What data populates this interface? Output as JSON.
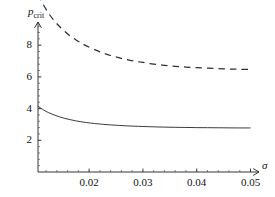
{
  "chart_data": {
    "type": "line",
    "title": "",
    "xlabel": "σ",
    "ylabel": "p_crit",
    "ylabel_base": "p",
    "ylabel_sub": "crit",
    "xlim": [
      0.0105,
      0.0514
    ],
    "ylim": [
      0.0,
      11.7
    ],
    "grid": false,
    "legend": "none",
    "xticks": [
      0.02,
      0.03,
      0.04,
      0.05
    ],
    "xtick_labels": [
      "0.02",
      "0.03",
      "0.04",
      "0.05"
    ],
    "yticks": [
      2,
      4,
      6,
      8,
      10
    ],
    "ytick_labels": [
      "2",
      "4",
      "6",
      "8",
      "10"
    ],
    "x_minor_per_interval": 4,
    "y_minor_per_interval": 4,
    "axis_arrows": true,
    "series": [
      {
        "name": "upper-branch",
        "style": "dashed",
        "color": "#303030",
        "x": [
          0.0105,
          0.0115,
          0.0125,
          0.0135,
          0.0145,
          0.0155,
          0.0165,
          0.0175,
          0.0185,
          0.0195,
          0.021,
          0.0225,
          0.024,
          0.0255,
          0.027,
          0.0285,
          0.03,
          0.032,
          0.034,
          0.036,
          0.038,
          0.04,
          0.042,
          0.044,
          0.046,
          0.048,
          0.05
        ],
        "y": [
          11.2,
          10.55,
          10.0,
          9.55,
          9.18,
          8.86,
          8.58,
          8.35,
          8.14,
          7.96,
          7.72,
          7.52,
          7.35,
          7.21,
          7.09,
          6.99,
          6.91,
          6.81,
          6.73,
          6.67,
          6.62,
          6.58,
          6.55,
          6.52,
          6.5,
          6.48,
          6.47
        ]
      },
      {
        "name": "lower-branch",
        "style": "solid",
        "color": "#303030",
        "x": [
          0.0105,
          0.0115,
          0.0125,
          0.0135,
          0.0145,
          0.0155,
          0.0165,
          0.0175,
          0.0185,
          0.0195,
          0.021,
          0.0225,
          0.024,
          0.0255,
          0.027,
          0.0285,
          0.03,
          0.032,
          0.034,
          0.036,
          0.038,
          0.04,
          0.042,
          0.044,
          0.046,
          0.048,
          0.05
        ],
        "y": [
          4.15,
          3.92,
          3.74,
          3.6,
          3.48,
          3.38,
          3.3,
          3.23,
          3.17,
          3.12,
          3.06,
          3.01,
          2.97,
          2.94,
          2.91,
          2.89,
          2.87,
          2.85,
          2.83,
          2.82,
          2.81,
          2.8,
          2.795,
          2.79,
          2.785,
          2.78,
          2.78
        ]
      }
    ]
  },
  "axes": {
    "x_axis_name": "sigma-axis",
    "y_axis_name": "p-crit-axis"
  }
}
